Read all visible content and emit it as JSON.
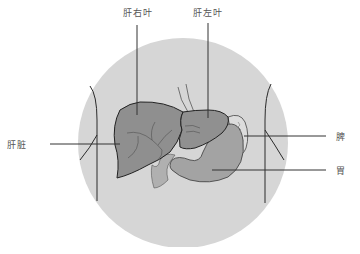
{
  "diagram": {
    "title": "",
    "labels": {
      "right_lobe": "肝右叶",
      "left_lobe": "肝左叶",
      "liver": "肝脏",
      "spleen": "脾",
      "stomach": "胃"
    },
    "colors": {
      "background_circle": "#d6d6d6",
      "liver": "#8f8f8f",
      "stomach": "#a3a3a3",
      "spleen": "#dcdcdc",
      "outline": "#2a2a2a",
      "leader_line": "#333333"
    }
  }
}
